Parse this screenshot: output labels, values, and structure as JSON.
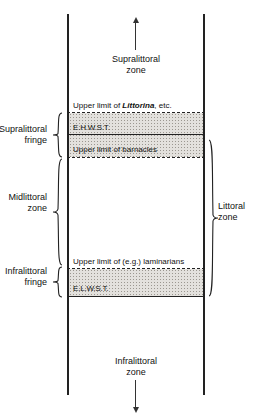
{
  "diagram": {
    "column": {
      "zones": [
        {
          "id": "supralittoral",
          "name_line1": "Supralittoral",
          "name_line2": "zone"
        },
        {
          "id": "midlittoral",
          "name_line1": "Midlittoral",
          "name_line2": "zone"
        },
        {
          "id": "infralittoral",
          "name_line1": "Infralittoral",
          "name_line2": "zone"
        }
      ],
      "boundaries": [
        {
          "id": "littorina",
          "label_prefix": "Upper limit of ",
          "label_italic": "Littorina",
          "label_suffix": ", etc.",
          "style": "dashed"
        },
        {
          "id": "ehwst",
          "label": "E.H.W.S.T.",
          "style": "solid"
        },
        {
          "id": "barnacles",
          "label": "Upper limit of barnacles",
          "style": "dashed"
        },
        {
          "id": "laminarians",
          "label": "Upper limit of (e.g.) laminarians",
          "style": "dashed"
        },
        {
          "id": "elwst",
          "label": "E.L.W.S.T.",
          "style": "solid"
        }
      ],
      "bands": [
        {
          "id": "supralittoral-fringe",
          "shaded": true
        },
        {
          "id": "infralittoral-fringe",
          "shaded": true
        }
      ]
    },
    "left_labels": [
      {
        "id": "supralittoral-fringe",
        "line1": "Supralittoral",
        "line2": "fringe"
      },
      {
        "id": "midlittoral-zone",
        "line1": "Midlittoral",
        "line2": "zone"
      },
      {
        "id": "infralittoral-fringe",
        "line1": "Infralittoral",
        "line2": "fringe"
      }
    ],
    "right_labels": [
      {
        "id": "littoral-zone",
        "line1": "Littoral",
        "line2": "zone"
      }
    ],
    "arrows": [
      {
        "id": "supralittoral-arrow",
        "direction": "up"
      },
      {
        "id": "infralittoral-arrow",
        "direction": "down"
      }
    ],
    "colors": {
      "line": "#222222",
      "band_fill": "#e3e1dd",
      "band_stipple": "#9b9790",
      "text": "#111111",
      "background": "#ffffff"
    }
  }
}
